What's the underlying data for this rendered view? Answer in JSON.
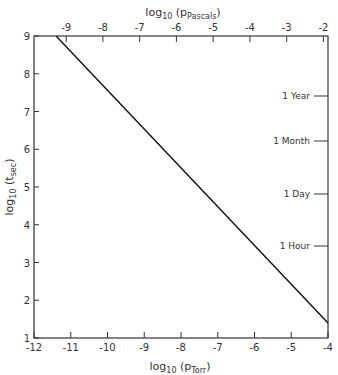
{
  "chart_data": {
    "type": "line",
    "title": "",
    "xlabel": "log10 (pTorr)",
    "xlabel_main": "log",
    "xlabel_sub": "10",
    "xlabel_rest": " (p",
    "xlabel_sub2": "Torr",
    "x2label_main": "log",
    "x2label_sub": "10",
    "x2label_rest": " (p",
    "x2label_sub2": "Pascals",
    "x2label": "log10 (pPascals)",
    "ylabel": "log10 (tsec)",
    "ylabel_main": "log",
    "ylabel_sub": "10",
    "ylabel_rest": " (t",
    "ylabel_sub2": "sec",
    "xlim": [
      -12,
      -4
    ],
    "ylim": [
      1,
      9
    ],
    "x_ticks": [
      -12,
      -11,
      -10,
      -9,
      -8,
      -7,
      -6,
      -5,
      -4
    ],
    "x_tick_labels": [
      "-12",
      "-11",
      "-10",
      "-9",
      "-8",
      "-7",
      "-6",
      "-5",
      "-4"
    ],
    "y_ticks": [
      1,
      2,
      3,
      4,
      5,
      6,
      7,
      8,
      9
    ],
    "y_tick_labels": [
      "1",
      "2",
      "3",
      "4",
      "5",
      "6",
      "7",
      "8",
      "9"
    ],
    "x2_ticks": [
      -9,
      -8,
      -7,
      -6,
      -5,
      -4,
      -3,
      -2
    ],
    "x2_tick_labels": [
      "-9",
      "-8",
      "-7",
      "-6",
      "-5",
      "-4",
      "-3",
      "-2"
    ],
    "grid": false,
    "series": [
      {
        "name": "monolayer formation time",
        "x": [
          -11.4,
          -4
        ],
        "y": [
          9,
          1.4
        ]
      }
    ],
    "annotations": [
      {
        "label": "1 Year",
        "y": 7.5
      },
      {
        "label": "1 Month",
        "y": 6.4
      },
      {
        "label": "1 Day",
        "y": 4.94
      },
      {
        "label": "1 Hour",
        "y": 3.56
      }
    ]
  }
}
